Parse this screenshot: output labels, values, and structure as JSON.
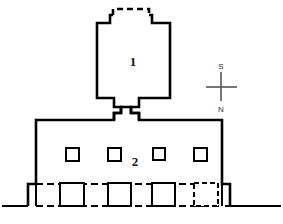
{
  "drawing": {
    "type": "architectural-elevation",
    "title": "",
    "background_color": "#ffffff",
    "line_color": "#000000",
    "labels": {
      "tower_label": "1",
      "main_block_label": "2"
    },
    "compass": {
      "top_letter": "S",
      "bottom_letter": "N",
      "orientation": "inverted-vertical-axis",
      "color": "#555555"
    },
    "parts": {
      "tower": {
        "name": "1",
        "has_dashed_roof_notch": true,
        "notch_style": "dashed",
        "outline_style": "solid"
      },
      "main_block": {
        "name": "2",
        "window_count": 4,
        "window_style": "solid-square",
        "outline_style": "solid"
      },
      "basement": {
        "outline_style": "dashed",
        "openings_solid": 3,
        "openings_dashed": 1
      },
      "ground_line": {
        "style": "solid"
      }
    },
    "legend_values": {
      "windows_upper": [
        "window",
        "window",
        "window",
        "window"
      ],
      "openings_lower": [
        "door",
        "door",
        "door",
        "door-hidden"
      ]
    }
  }
}
